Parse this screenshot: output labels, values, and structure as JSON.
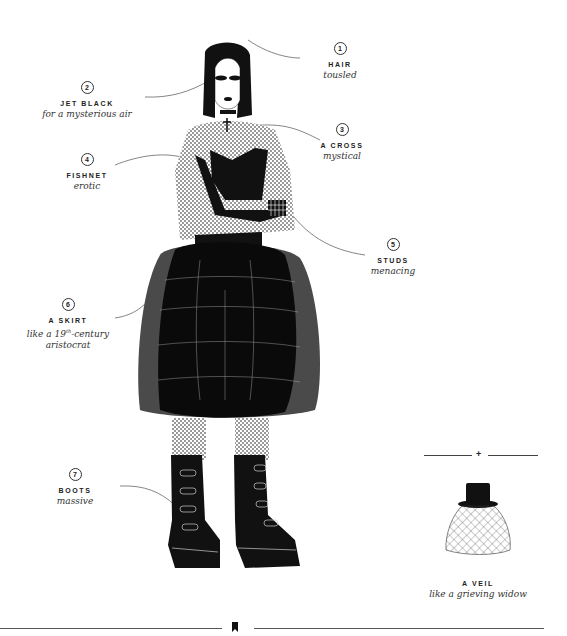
{
  "annotations": [
    {
      "number": "1",
      "title": "HAIR",
      "subtitle": "tousled"
    },
    {
      "number": "2",
      "title": "JET BLACK",
      "subtitle": "for a mysterious air"
    },
    {
      "number": "3",
      "title": "A CROSS",
      "subtitle": "mystical"
    },
    {
      "number": "4",
      "title": "FISHNET",
      "subtitle": "erotic"
    },
    {
      "number": "5",
      "title": "STUDS",
      "subtitle": "menacing"
    },
    {
      "number": "6",
      "title": "A SKIRT",
      "subtitle_pre": "like a 19",
      "subtitle_sup": "th",
      "subtitle_post": "-century",
      "subtitle_line2": "aristocrat"
    },
    {
      "number": "7",
      "title": "BOOTS",
      "subtitle": "massive"
    }
  ],
  "accessory": {
    "title": "A VEIL",
    "subtitle": "like a grieving widow",
    "divider_glyph": "+"
  },
  "footer": {
    "icon": "bookmark-icon"
  },
  "colors": {
    "ink": "#111111",
    "skirt_outer": "#4a4a4a",
    "background": "#ffffff",
    "text": "#222222"
  }
}
